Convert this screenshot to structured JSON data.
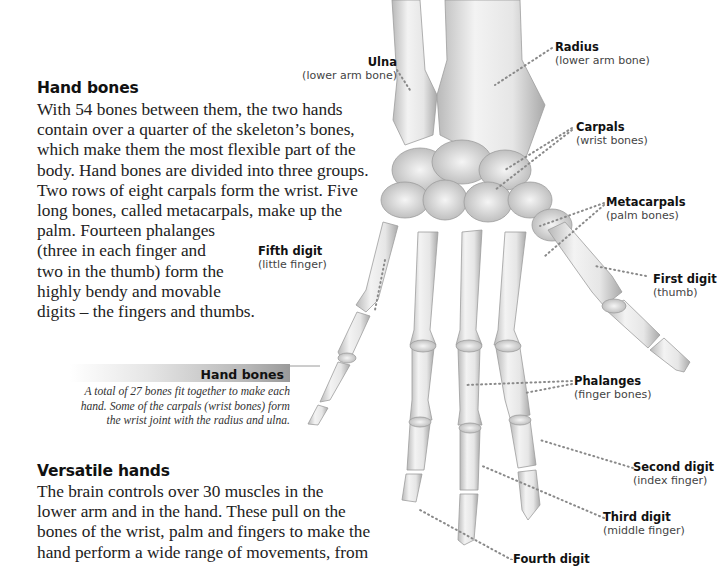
{
  "sections": [
    {
      "heading": "Hand bones",
      "lines": [
        "With 54 bones between them, the two hands",
        "contain over a quarter of the skeleton’s bones,",
        "which make them the most flexible part of the",
        "body. Hand bones are divided into three groups.",
        "Two rows of eight carpals form the wrist. Five",
        "long bones, called metacarpals, make up the",
        "palm. Fourteen phalanges",
        "(three in each finger and",
        "two in the thumb) form the",
        "highly bendy and movable",
        "digits – the fingers and thumbs."
      ]
    },
    {
      "heading": "Versatile hands",
      "lines": [
        "The brain controls over 30 muscles in the",
        "lower arm and in the hand. These pull on the",
        "bones of the wrist, palm and fingers to make the",
        "hand perform a wide range of movements, from"
      ]
    }
  ],
  "caption": {
    "title": "Hand bones",
    "lines": [
      "A total of 27 bones fit together to make each",
      "hand. Some of the carpals (wrist bones) form",
      "the wrist joint with the radius and ulna."
    ]
  },
  "labels": {
    "ulna": {
      "title": "Ulna",
      "sub": "(lower arm bone)"
    },
    "radius": {
      "title": "Radius",
      "sub": "(lower arm bone)"
    },
    "carpals": {
      "title": "Carpals",
      "sub": "(wrist bones)"
    },
    "metacarpals": {
      "title": "Metacarpals",
      "sub": "(palm bones)"
    },
    "fifth": {
      "title": "Fifth digit",
      "sub": "(little finger)"
    },
    "first": {
      "title": "First digit",
      "sub": "(thumb)"
    },
    "phalanges": {
      "title": "Phalanges",
      "sub": "(finger bones)"
    },
    "second": {
      "title": "Second digit",
      "sub": "(index finger)"
    },
    "third": {
      "title": "Third digit",
      "sub": "(middle finger)"
    },
    "fourth": {
      "title": "Fourth digit",
      "sub": ""
    }
  },
  "colors": {
    "bone": "#e9e9e9",
    "bone_shade": "#bdbdbd",
    "leader": "#8a8a8a"
  }
}
